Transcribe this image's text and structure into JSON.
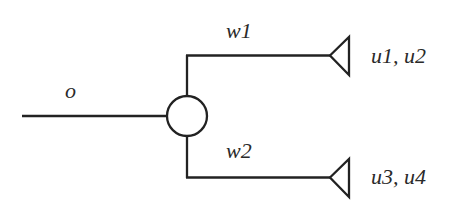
{
  "diagram": {
    "input_link": {
      "label": "o"
    },
    "splitter": {
      "shape": "circle"
    },
    "branches": [
      {
        "label": "w1",
        "terminal_shape": "triangle",
        "terminal_label": "u1, u2"
      },
      {
        "label": "w2",
        "terminal_shape": "triangle",
        "terminal_label": "u3, u4"
      }
    ],
    "colors": {
      "stroke": "#222222",
      "text": "#2a2a2a",
      "background": "#ffffff"
    }
  }
}
